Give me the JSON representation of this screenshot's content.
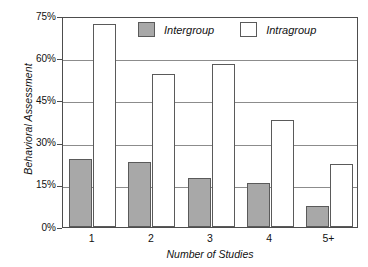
{
  "chart_data": {
    "type": "bar",
    "title": "",
    "xlabel": "Number of Studies",
    "ylabel": "Behavioral Assessment",
    "categories": [
      "1",
      "2",
      "3",
      "4",
      "5+"
    ],
    "series": [
      {
        "name": "Intergroup",
        "color": "#a8a8a8",
        "values": [
          24,
          23,
          17.5,
          15.5,
          7.5
        ]
      },
      {
        "name": "Intragroup",
        "color": "#ffffff",
        "values": [
          72,
          54.5,
          58,
          38,
          22.5
        ]
      }
    ],
    "ylim": [
      0,
      75
    ],
    "ytick_values": [
      0,
      15,
      30,
      45,
      60,
      75
    ],
    "ytick_labels": [
      "0%",
      "15%",
      "30%",
      "45%",
      "60%",
      "75%"
    ],
    "grid": true,
    "legend_position": "top-center",
    "value_unit": "%"
  },
  "axes": {
    "y_title": "Behavioral Assessment",
    "x_title": "Number of Studies"
  },
  "legend": {
    "items": [
      {
        "label": "Intergroup",
        "swatch": "gray-square-swatch"
      },
      {
        "label": "Intragroup",
        "swatch": "white-square-swatch"
      }
    ]
  }
}
